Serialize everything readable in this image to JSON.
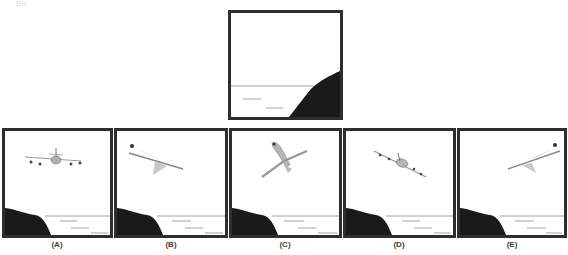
{
  "corner_mark": "SH",
  "question_figure": {
    "name": "question-figure",
    "description": "Cliff with sea and horizon line, no airplane"
  },
  "options": [
    {
      "label": "(A)",
      "airplane_view": "front-view-level"
    },
    {
      "label": "(B)",
      "airplane_view": "side-view-banking-left-up"
    },
    {
      "label": "(C)",
      "airplane_view": "top-view-climbing"
    },
    {
      "label": "(D)",
      "airplane_view": "front-view-banking"
    },
    {
      "label": "(E)",
      "airplane_view": "side-view-banking-right-up"
    }
  ],
  "colors": {
    "frame_border": "#2e2e2e",
    "cliff": "#1a1a1a",
    "horizon": "#8a8a8a",
    "airplane": "#a8a8a8"
  }
}
